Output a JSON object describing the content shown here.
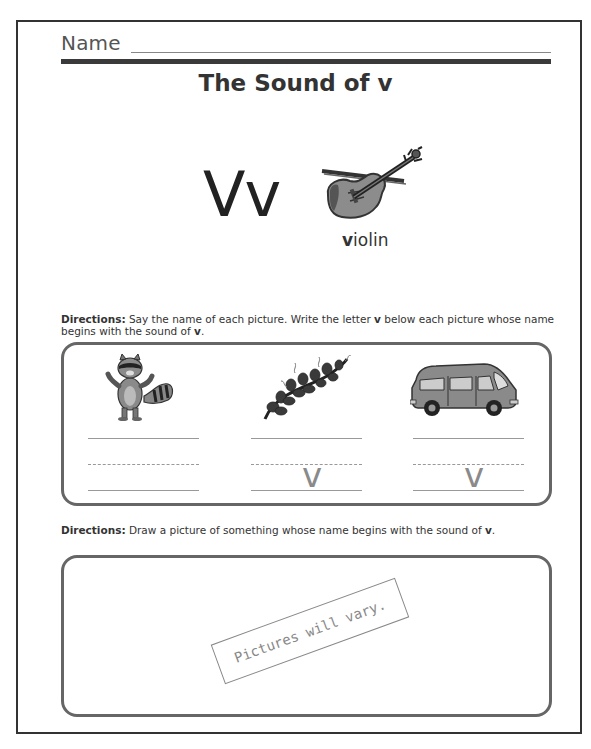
{
  "header": {
    "name_label": "Name",
    "title": "The Sound of v"
  },
  "intro": {
    "letters": "Vv",
    "picture": {
      "icon": "violin-icon",
      "word_first_letter": "v",
      "word_rest": "iolin"
    }
  },
  "section1": {
    "directions_label": "Directions:",
    "directions_text_1": " Say the name of each picture. Write the letter ",
    "directions_bold_1": "v",
    "directions_text_2": " below each picture whose name begins with the sound of ",
    "directions_bold_2": "v",
    "directions_text_3": ".",
    "items": [
      {
        "icon": "raccoon-icon",
        "answer": ""
      },
      {
        "icon": "vine-icon",
        "answer": "v"
      },
      {
        "icon": "van-icon",
        "answer": "v"
      }
    ]
  },
  "section2": {
    "directions_label": "Directions:",
    "directions_text_1": " Draw a picture of something whose name begins with the sound of ",
    "directions_bold_1": "v",
    "directions_text_2": ".",
    "stamp_text": "Pictures will vary."
  },
  "colors": {
    "frame": "#333333",
    "box_border": "#666666",
    "answer": "#8a8a8a"
  }
}
